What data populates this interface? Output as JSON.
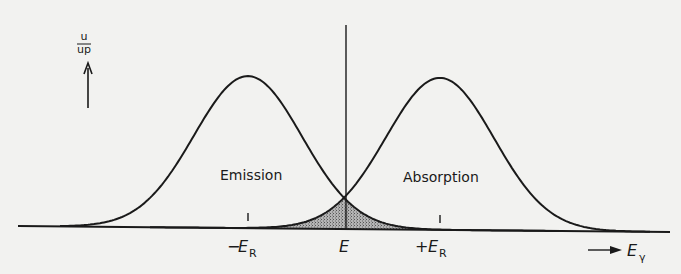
{
  "figure": {
    "y_axis_label": "dn/n",
    "y_axis_label_num": "dn",
    "y_axis_label_den": "n",
    "x_axis_label": "E",
    "x_axis_label_sub": "γ",
    "curves": {
      "emission_label": "Emission",
      "absorption_label": "Absorption"
    },
    "ticks": {
      "minus_er_sign": "−",
      "minus_er_main": "E",
      "minus_er_sub": "R",
      "center": "E",
      "plus_er_sign": "+",
      "plus_er_main": "E",
      "plus_er_sub": "R"
    },
    "colors": {
      "line": "#1a1a1a",
      "overlap_fill": "#9a9a9a",
      "background": "#f2f2f0"
    }
  },
  "chart_data": {
    "type": "line",
    "title": "",
    "xlabel": "E_γ",
    "ylabel": "dn/n",
    "x_ticks": [
      "−E_R",
      "E",
      "+E_R"
    ],
    "series": [
      {
        "name": "Emission",
        "center": "-E_R",
        "shape": "gaussian",
        "relative_peak": 1.0
      },
      {
        "name": "Absorption",
        "center": "+E_R",
        "shape": "gaussian",
        "relative_peak": 1.0
      }
    ],
    "annotations": [
      "Shaded overlap region centered at E where the two curves cross (~0.21 of peak height)"
    ],
    "grid": false,
    "legend": "none"
  }
}
